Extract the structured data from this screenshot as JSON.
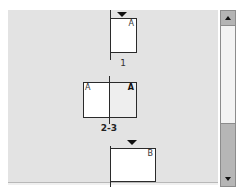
{
  "panel": {
    "name": "Pages",
    "background": "#e3e3e3"
  },
  "pages": [
    {
      "label": "1",
      "master": "A",
      "type": "single",
      "has_active_marker": true,
      "marker_icon": "triangle-down-icon"
    },
    {
      "label": "2-3",
      "type": "spread",
      "left_master": "A",
      "right_master": "A",
      "right_selected": true
    },
    {
      "label": "",
      "master": "B",
      "type": "single",
      "has_active_marker": true,
      "marker_icon": "triangle-down-icon"
    }
  ],
  "scrollbar": {
    "up_icon": "arrow-up-icon",
    "down_icon": "arrow-down-icon",
    "thumb_position": "bottom"
  }
}
